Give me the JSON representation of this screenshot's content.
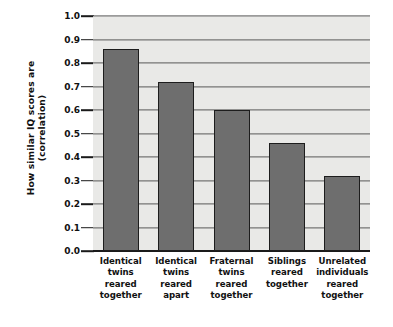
{
  "chart_data": {
    "type": "bar",
    "title": "",
    "xlabel": "",
    "ylabel": "How similar IQ scores are (correlation)",
    "ylabel_lines": [
      "How similar IQ scores are",
      "(correlation)"
    ],
    "ylim": [
      0.0,
      1.0
    ],
    "grid": true,
    "legend": "none",
    "y_ticks": [
      "1.0",
      "0.9",
      "0.8",
      "0.7",
      "0.6",
      "0.5",
      "0.4",
      "0.3",
      "0.2",
      "0.1",
      "0.0"
    ],
    "y_tick_values": [
      1.0,
      0.9,
      0.8,
      0.7,
      0.6,
      0.5,
      0.4,
      0.3,
      0.2,
      0.1,
      0.0
    ],
    "categories": [
      "Identical twins reared together",
      "Identical twins reared apart",
      "Fraternal twins reared together",
      "Siblings reared together",
      "Unrelated individuals reared together"
    ],
    "category_lines": [
      [
        "Identical",
        "twins",
        "reared",
        "together"
      ],
      [
        "Identical",
        "twins",
        "reared",
        "apart"
      ],
      [
        "Fraternal",
        "twins",
        "reared",
        "together"
      ],
      [
        "Siblings",
        "reared",
        "together"
      ],
      [
        "Unrelated",
        "individuals",
        "reared",
        "together"
      ]
    ],
    "values": [
      0.86,
      0.72,
      0.6,
      0.46,
      0.32
    ],
    "colors": {
      "bar_fill": "#6e6e6e",
      "bar_edge": "#1d1d1d",
      "plot_background": "#e9e9e7",
      "gridline": "#585858",
      "axis": "#1a1a1a",
      "figure_background": "#ffffff",
      "text": "#111111"
    }
  }
}
